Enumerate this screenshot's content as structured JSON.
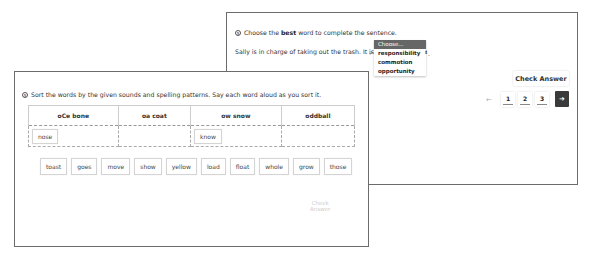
{
  "back_card": {
    "question_number_icon": "circled-number-icon",
    "prompt_before": "Choose the ",
    "prompt_bold": "best",
    "prompt_after": " word to complete the sentence.",
    "sentence": "Sally is in charge of taking out the trash. It is he",
    "sentence_end": ".",
    "dropdown": {
      "placeholder": "Choose...",
      "options": [
        "responsibility",
        "commotion",
        "opportunity"
      ],
      "checked": "responsibility"
    },
    "check_answer": "Check Answer",
    "pagination": {
      "prev": "←",
      "pages": [
        "1",
        "2",
        "3"
      ],
      "next": "➜"
    }
  },
  "front_card": {
    "question_number_icon": "circled-number-icon",
    "prompt": "Sort the words by the given sounds and spelling patterns. Say each word aloud as you sort it.",
    "columns": [
      "oCe bone",
      "oa coat",
      "ow snow",
      "oddball"
    ],
    "placed": [
      "nose",
      "",
      "know",
      ""
    ],
    "word_bank": [
      "toast",
      "goes",
      "move",
      "show",
      "yellow",
      "load",
      "float",
      "whole",
      "grow",
      "those"
    ],
    "check_answer": "Check Answer"
  }
}
